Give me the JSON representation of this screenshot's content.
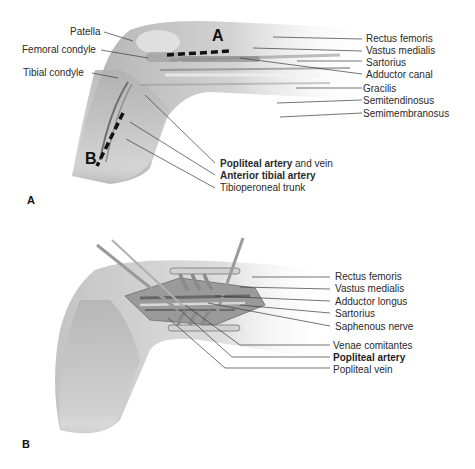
{
  "panel_a": {
    "panel_letter": "A",
    "incision_labels": {
      "a": "A",
      "b": "B"
    },
    "left_labels": [
      {
        "text": "Patella"
      },
      {
        "text": "Femoral condyle"
      },
      {
        "text": "Tibial condyle"
      }
    ],
    "right_labels": [
      {
        "text": "Rectus femoris"
      },
      {
        "text": "Vastus medialis"
      },
      {
        "text": "Sartorius"
      },
      {
        "text": "Adductor canal"
      },
      {
        "text": "Gracilis"
      },
      {
        "text": "Semitendinosus"
      },
      {
        "text": "Semimembranosus"
      }
    ],
    "bottom_labels": [
      {
        "bold": "Popliteal artery",
        "rest": " and vein"
      },
      {
        "bold": "Anterior tibial artery",
        "rest": ""
      },
      {
        "bold": "",
        "rest": "Tibioperoneal trunk"
      }
    ]
  },
  "panel_b": {
    "panel_letter": "B",
    "labels": [
      {
        "text": "Rectus femoris",
        "bold": false
      },
      {
        "text": "Vastus medialis",
        "bold": false
      },
      {
        "text": "Adductor longus",
        "bold": false
      },
      {
        "text": "Sartorius",
        "bold": false
      },
      {
        "text": "Saphenous nerve",
        "bold": false
      },
      {
        "text": "Venae comitantes",
        "bold": false
      },
      {
        "text": "Popliteal artery",
        "bold": true
      },
      {
        "text": "Popliteal vein",
        "bold": false
      }
    ]
  },
  "colors": {
    "skin": "#c9c9c9",
    "skin_dark": "#9a9a9a",
    "leader": "#3a3a3a",
    "incision": "#111111"
  }
}
